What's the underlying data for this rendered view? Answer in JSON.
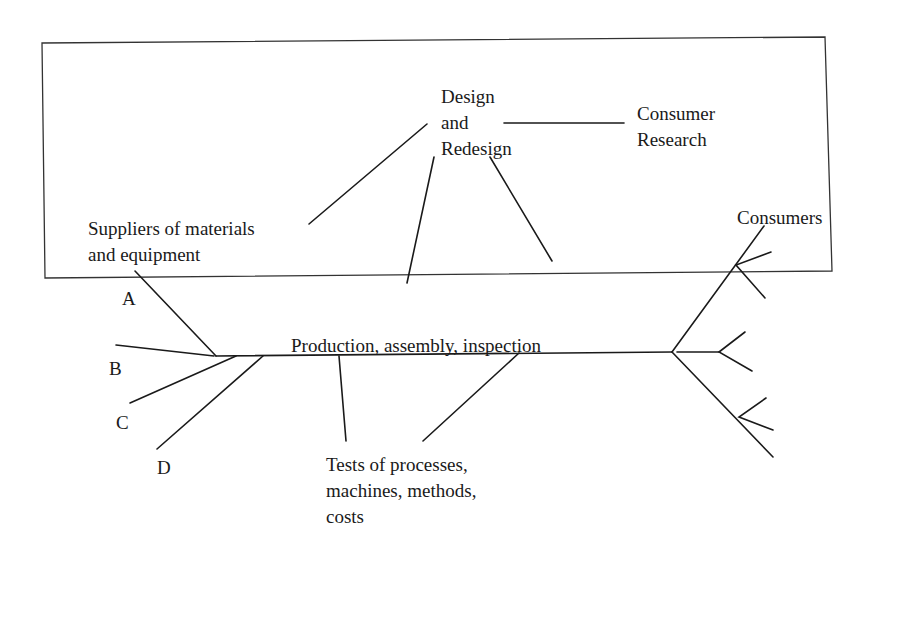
{
  "diagram": {
    "type": "flow-diagram",
    "title": "",
    "border": {
      "x1": 42,
      "y1": 42,
      "x2": 410,
      "y2": 37,
      "x3": 412,
      "y3": 268,
      "x4": 45,
      "y4": 278
    },
    "frame_rect": {
      "left": [
        42,
        42,
        45,
        278
      ],
      "top": [
        42,
        42,
        410,
        37
      ],
      "right": [
        406,
        37,
        410,
        270
      ],
      "bottom": [
        45,
        278,
        410,
        272
      ]
    },
    "labels": {
      "design": "Design\nand\nRedesign",
      "consumer_research": "Consumer\nResearch",
      "suppliers": "Suppliers of materials\nand equipment",
      "a": "A",
      "b": "B",
      "c": "C",
      "d": "D",
      "production": "Production, assembly, inspection",
      "tests": "Tests of processes,\nmachines, methods,\ncosts",
      "consumers": "Consumers"
    },
    "stroke_color": "#1a1a1a",
    "background": "#ffffff"
  }
}
